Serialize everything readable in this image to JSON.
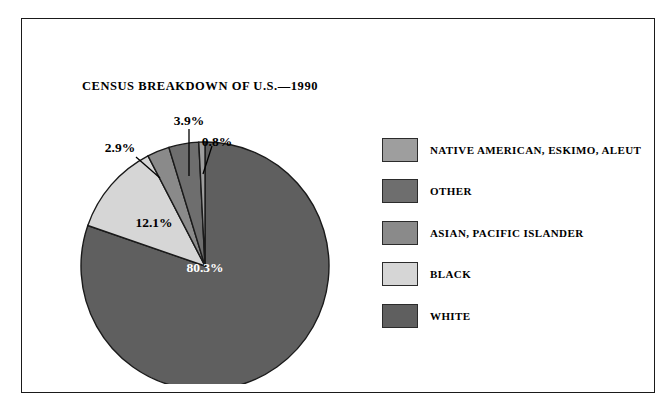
{
  "chart_data": {
    "type": "pie",
    "title": "CENSUS BREAKDOWN OF U.S.—1990",
    "xlabel": "",
    "ylabel": "",
    "legend_position": "right",
    "grid": false,
    "start_angle_deg": 0,
    "direction": "clockwise",
    "categories": [
      "WHITE",
      "BLACK",
      "ASIAN, PACIFIC ISLANDER",
      "OTHER",
      "NATIVE AMERICAN, ESKIMO, ALEUT"
    ],
    "values": [
      80.3,
      12.1,
      2.9,
      3.9,
      0.8
    ],
    "value_labels": [
      "80.3%",
      "12.1%",
      "2.9%",
      "3.9%",
      "0.8%"
    ],
    "colors": [
      "#5f5f5f",
      "#d6d6d6",
      "#8a8a8a",
      "#6e6e6e",
      "#9e9e9e"
    ],
    "units": "percent"
  },
  "legend": {
    "items": [
      {
        "label": "NATIVE AMERICAN, ESKIMO, ALEUT",
        "color": "#9e9e9e"
      },
      {
        "label": "OTHER",
        "color": "#6e6e6e"
      },
      {
        "label": "ASIAN, PACIFIC ISLANDER",
        "color": "#8a8a8a"
      },
      {
        "label": "BLACK",
        "color": "#d6d6d6"
      },
      {
        "label": "WHITE",
        "color": "#5f5f5f"
      }
    ]
  },
  "labels": {
    "white": "80.3%",
    "black": "12.1%",
    "asian": "2.9%",
    "other": "3.9%",
    "native": "0.8%"
  },
  "style": {
    "frame_color": "#1a1a1a",
    "background": "#ffffff",
    "slice_outline": "#1a1a1a",
    "label_on_dark": "#ffffff",
    "label_on_light": "#000000"
  }
}
